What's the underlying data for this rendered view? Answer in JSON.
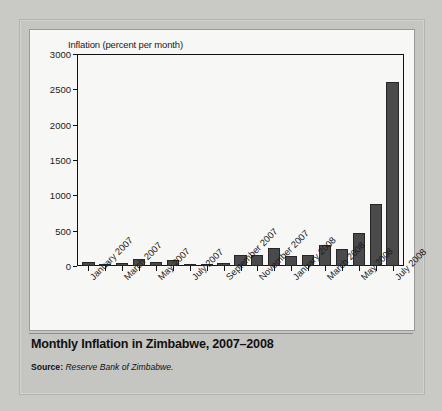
{
  "figure": {
    "title": "Monthly Inflation in Zimbabwe, 2007–2008",
    "source_label": "Source:",
    "source_text": "Reserve Bank of Zimbabwe."
  },
  "chart_data": {
    "type": "bar",
    "title": "Monthly Inflation in Zimbabwe, 2007–2008",
    "xlabel": "",
    "ylabel": "Inflation (percent per month)",
    "ylim": [
      0,
      3000
    ],
    "yticks": [
      0,
      500,
      1000,
      1500,
      2000,
      2500,
      3000
    ],
    "grid": false,
    "legend": null,
    "bar_color": "#4a4a4a",
    "categories": [
      "January 2007",
      "February 2007",
      "March 2007",
      "April 2007",
      "May 2007",
      "June 2007",
      "July 2007",
      "August 2007",
      "September 2007",
      "October 2007",
      "November 2007",
      "December 2007",
      "January 2008",
      "February 2008",
      "March 2008",
      "April 2008",
      "May 2008",
      "June 2008",
      "July 2008"
    ],
    "tick_labels": [
      "January 2007",
      "",
      "March 2007",
      "",
      "May 2007",
      "",
      "July 2007",
      "",
      "September 2007",
      "",
      "November 2007",
      "",
      "January 2008",
      "",
      "March 2008",
      "",
      "May 2008",
      "",
      "July 2008"
    ],
    "values": [
      50,
      30,
      45,
      95,
      50,
      90,
      30,
      15,
      45,
      150,
      150,
      260,
      145,
      160,
      300,
      240,
      470,
      880,
      2600
    ]
  }
}
